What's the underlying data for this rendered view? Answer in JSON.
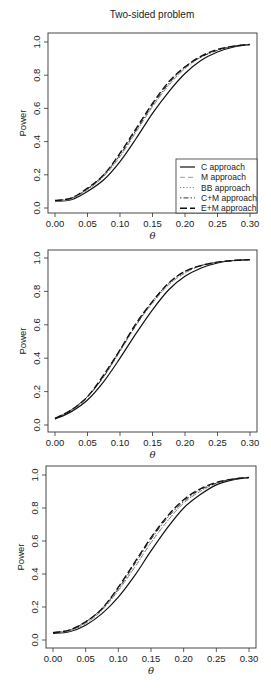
{
  "figure": {
    "title": "Two-sided problem"
  },
  "chart_data": [
    {
      "type": "line",
      "title": "Two-sided problem",
      "xlabel": "θ",
      "ylabel": "Power",
      "xlim": [
        0.0,
        0.3
      ],
      "ylim": [
        0.0,
        1.0
      ],
      "xticks": [
        "0.00",
        "0.05",
        "0.10",
        "0.15",
        "0.20",
        "0.25",
        "0.30"
      ],
      "yticks": [
        "0.0",
        "0.2",
        "0.4",
        "0.6",
        "0.8",
        "1.0"
      ],
      "grid": false,
      "legend_position": "bottom-right",
      "x": [
        0.0,
        0.025,
        0.05,
        0.075,
        0.1,
        0.125,
        0.15,
        0.175,
        0.2,
        0.225,
        0.25,
        0.275,
        0.3
      ],
      "series": [
        {
          "name": "C approach",
          "style": "solid",
          "values": [
            0.04,
            0.05,
            0.1,
            0.17,
            0.28,
            0.42,
            0.57,
            0.7,
            0.81,
            0.89,
            0.94,
            0.97,
            0.985
          ]
        },
        {
          "name": "M approach",
          "style": "dashed-light",
          "values": [
            0.04,
            0.055,
            0.11,
            0.19,
            0.31,
            0.46,
            0.61,
            0.74,
            0.84,
            0.91,
            0.95,
            0.975,
            0.985
          ]
        },
        {
          "name": "BB approach",
          "style": "dotted",
          "values": [
            0.04,
            0.055,
            0.11,
            0.19,
            0.31,
            0.46,
            0.61,
            0.74,
            0.84,
            0.91,
            0.95,
            0.975,
            0.985
          ]
        },
        {
          "name": "C+M approach",
          "style": "dotdash",
          "values": [
            0.045,
            0.06,
            0.115,
            0.2,
            0.32,
            0.47,
            0.62,
            0.75,
            0.85,
            0.91,
            0.95,
            0.975,
            0.985
          ]
        },
        {
          "name": "E+M approach",
          "style": "longdash",
          "values": [
            0.045,
            0.06,
            0.12,
            0.2,
            0.33,
            0.48,
            0.63,
            0.76,
            0.85,
            0.915,
            0.955,
            0.975,
            0.985
          ]
        }
      ]
    },
    {
      "type": "line",
      "title": "",
      "xlabel": "θ",
      "ylabel": "Power",
      "xlim": [
        0.0,
        0.3
      ],
      "ylim": [
        0.0,
        1.0
      ],
      "xticks": [
        "0.00",
        "0.05",
        "0.10",
        "0.15",
        "0.20",
        "0.25",
        "0.30"
      ],
      "yticks": [
        "0.0",
        "0.2",
        "0.4",
        "0.6",
        "0.8",
        "1.0"
      ],
      "grid": false,
      "x": [
        0.0,
        0.025,
        0.05,
        0.075,
        0.1,
        0.125,
        0.15,
        0.175,
        0.2,
        0.225,
        0.25,
        0.275,
        0.3
      ],
      "series": [
        {
          "name": "C approach",
          "style": "solid",
          "values": [
            0.035,
            0.08,
            0.15,
            0.26,
            0.4,
            0.55,
            0.69,
            0.81,
            0.89,
            0.94,
            0.97,
            0.985,
            0.99
          ]
        },
        {
          "name": "M approach",
          "style": "dashed-light",
          "values": [
            0.04,
            0.09,
            0.17,
            0.29,
            0.44,
            0.6,
            0.73,
            0.84,
            0.91,
            0.955,
            0.975,
            0.985,
            0.99
          ]
        },
        {
          "name": "BB approach",
          "style": "dotted",
          "values": [
            0.04,
            0.09,
            0.17,
            0.29,
            0.44,
            0.6,
            0.73,
            0.84,
            0.91,
            0.955,
            0.975,
            0.985,
            0.99
          ]
        },
        {
          "name": "C+M approach",
          "style": "dotdash",
          "values": [
            0.04,
            0.09,
            0.17,
            0.29,
            0.45,
            0.6,
            0.74,
            0.85,
            0.92,
            0.955,
            0.975,
            0.985,
            0.99
          ]
        },
        {
          "name": "E+M approach",
          "style": "longdash",
          "values": [
            0.04,
            0.09,
            0.17,
            0.3,
            0.45,
            0.61,
            0.74,
            0.85,
            0.92,
            0.955,
            0.975,
            0.985,
            0.99
          ]
        }
      ]
    },
    {
      "type": "line",
      "title": "",
      "xlabel": "θ",
      "ylabel": "Power",
      "xlim": [
        0.0,
        0.3
      ],
      "ylim": [
        0.0,
        1.0
      ],
      "xticks": [
        "0.00",
        "0.05",
        "0.10",
        "0.15",
        "0.20",
        "0.25",
        "0.30"
      ],
      "yticks": [
        "0.0",
        "0.2",
        "0.4",
        "0.6",
        "0.8",
        "1.0"
      ],
      "grid": false,
      "x": [
        0.0,
        0.025,
        0.05,
        0.075,
        0.1,
        0.125,
        0.15,
        0.175,
        0.2,
        0.225,
        0.25,
        0.275,
        0.3
      ],
      "series": [
        {
          "name": "C approach",
          "style": "solid",
          "values": [
            0.04,
            0.05,
            0.09,
            0.16,
            0.26,
            0.39,
            0.54,
            0.68,
            0.8,
            0.88,
            0.94,
            0.97,
            0.985
          ]
        },
        {
          "name": "M approach",
          "style": "dashed-light",
          "values": [
            0.045,
            0.055,
            0.1,
            0.18,
            0.3,
            0.44,
            0.59,
            0.72,
            0.83,
            0.9,
            0.95,
            0.975,
            0.985
          ]
        },
        {
          "name": "BB approach",
          "style": "dotted",
          "values": [
            0.045,
            0.055,
            0.1,
            0.18,
            0.3,
            0.44,
            0.59,
            0.72,
            0.83,
            0.9,
            0.95,
            0.975,
            0.985
          ]
        },
        {
          "name": "C+M approach",
          "style": "dotdash",
          "values": [
            0.045,
            0.06,
            0.11,
            0.19,
            0.31,
            0.46,
            0.61,
            0.74,
            0.84,
            0.91,
            0.95,
            0.975,
            0.985
          ]
        },
        {
          "name": "E+M approach",
          "style": "longdash",
          "values": [
            0.045,
            0.06,
            0.11,
            0.19,
            0.32,
            0.47,
            0.62,
            0.75,
            0.85,
            0.915,
            0.955,
            0.975,
            0.985
          ]
        }
      ]
    }
  ],
  "legend": {
    "items": [
      {
        "label": "C approach",
        "style": "solid"
      },
      {
        "label": "M approach",
        "style": "dashed-light"
      },
      {
        "label": "BB approach",
        "style": "dotted"
      },
      {
        "label": "C+M approach",
        "style": "dotdash"
      },
      {
        "label": "E+M approach",
        "style": "longdash"
      }
    ]
  },
  "styles": {
    "solid": {
      "color": "#111111",
      "dash": "",
      "width": 1.2
    },
    "dashed-light": {
      "color": "#9a9a9a",
      "dash": "5 3",
      "width": 1.0
    },
    "dotted": {
      "color": "#777777",
      "dash": "1.2 2",
      "width": 1.0
    },
    "dotdash": {
      "color": "#333333",
      "dash": "1.5 2 5 2",
      "width": 1.0
    },
    "longdash": {
      "color": "#111111",
      "dash": "7 3",
      "width": 1.4
    }
  }
}
